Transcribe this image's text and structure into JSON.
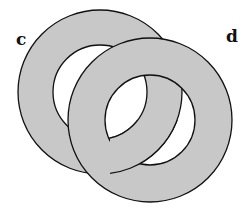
{
  "labels": {
    "left_ring": "c",
    "right_ring": "d"
  },
  "colors": {
    "ring_fill": "#c8c8c8",
    "stroke": "#111111",
    "background": "#ffffff"
  },
  "rings": [
    {
      "name": "c",
      "cx": 100,
      "cy": 92,
      "r_outer": 82,
      "r_inner": 47
    },
    {
      "name": "d",
      "cx": 150,
      "cy": 120,
      "r_outer": 82,
      "r_inner": 45
    }
  ]
}
